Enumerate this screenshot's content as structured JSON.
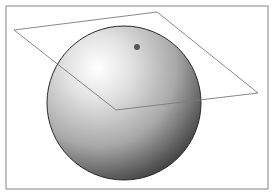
{
  "diagram": {
    "colors": {
      "background": "#ffffff",
      "frame": "#9a9a9a",
      "plane_line": "#7a7a7a",
      "sphere_highlight": "#ffffff",
      "sphere_mid": "#b5b5b5",
      "sphere_shadow": "#3a3a3a",
      "sphere_outline": "#2a2a2a",
      "point": "#555555"
    },
    "frame": {
      "x": 6,
      "y": 6,
      "w": 262,
      "h": 183
    },
    "sphere": {
      "cx": 124,
      "cy": 103,
      "r": 77
    },
    "plane": {
      "points": [
        [
          14,
          30
        ],
        [
          157,
          12
        ],
        [
          258,
          93
        ],
        [
          116,
          110
        ]
      ]
    },
    "point": {
      "cx": 137,
      "cy": 47,
      "r": 3
    }
  }
}
